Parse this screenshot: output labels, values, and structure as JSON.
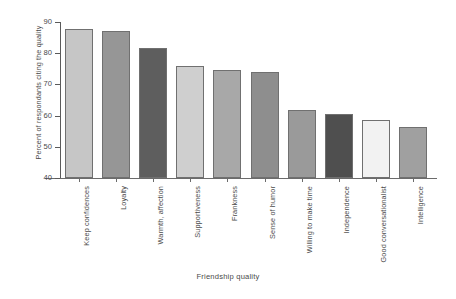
{
  "chart_data": {
    "type": "bar",
    "title": "",
    "xlabel": "Friendship quality",
    "ylabel": "Percent of respondants citing the quality",
    "ylim": [
      40,
      90
    ],
    "yticks": [
      40,
      50,
      60,
      70,
      80,
      90
    ],
    "grid": false,
    "legend": null,
    "categories": [
      "Keep confidences",
      "Loyalty",
      "Warmth, affection",
      "Supportiveness",
      "Frankness",
      "Sense of humor",
      "Willing to make time",
      "Independence",
      "Good conversationalist",
      "Intelligence"
    ],
    "values": [
      87.7,
      87.0,
      81.7,
      76.0,
      74.7,
      74.0,
      61.8,
      60.5,
      58.5,
      56.5
    ],
    "bar_colors": [
      "#c6c6c6",
      "#969696",
      "#5e5e5e",
      "#cfcfcf",
      "#a8a8a8",
      "#8e8e8e",
      "#9a9a9a",
      "#4f4f4f",
      "#f2f2f2",
      "#a0a0a0"
    ],
    "bar_border_color": "#707070",
    "axis_color": "#5a5a5a",
    "text_color": "#4a4a4a",
    "background": "#ffffff"
  }
}
